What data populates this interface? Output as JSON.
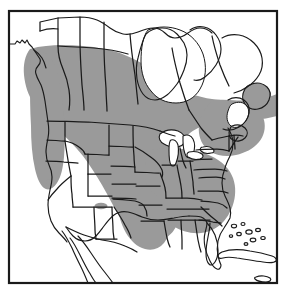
{
  "figure": {
    "type": "species-range-map",
    "region": "North America",
    "title": "",
    "caption": "",
    "width": 286,
    "height": 291
  },
  "style": {
    "background_color": "#ffffff",
    "land_fill": "#ffffff",
    "range_fill": "#9a9a9a",
    "outline_color": "#1a1a1a",
    "frame_color": "#1a1a1a",
    "frame_width": 2.2,
    "coast_width": 1.1,
    "border_width": 1.3
  },
  "frame": {
    "x": 9,
    "y": 11,
    "width": 268,
    "height": 272
  },
  "legend": {
    "items": [
      {
        "label": "",
        "swatch": "#9a9a9a",
        "meaning": "breeding range"
      }
    ],
    "visible": false
  },
  "map": {
    "landmasses": [
      "North American mainland",
      "Alaska panhandle",
      "Canadian Arctic coast",
      "Hudson Bay",
      "Newfoundland",
      "Nova Scotia",
      "Florida peninsula",
      "Baja California",
      "Bahamas",
      "Cuba"
    ],
    "water_bodies": [
      "Hudson Bay",
      "Great Lakes",
      "Gulf of Mexico",
      "Gulf of California",
      "Gulf of St. Lawrence",
      "Atlantic Ocean",
      "Pacific Ocean"
    ],
    "great_lakes": [
      "Lake Superior",
      "Lake Michigan",
      "Lake Huron",
      "Lake Erie",
      "Lake Ontario"
    ],
    "shaded_regions": [
      "British Columbia interior",
      "Alberta",
      "Saskatchewan",
      "Manitoba",
      "Ontario",
      "Quebec",
      "Maritimes",
      "Washington",
      "Oregon",
      "Montana",
      "Wyoming",
      "Colorado",
      "North Dakota",
      "South Dakota",
      "Nebraska",
      "Kansas",
      "Minnesota",
      "Iowa",
      "Missouri",
      "Arkansas",
      "Louisiana",
      "Mississippi",
      "Alabama",
      "Tennessee",
      "Kentucky",
      "Illinois",
      "Indiana",
      "Ohio",
      "Michigan",
      "Wisconsin",
      "Pennsylvania",
      "New York",
      "New England",
      "Virginia",
      "West Virginia",
      "North Carolina",
      "South Carolina",
      "Georgia"
    ],
    "unshaded_regions": [
      "Northern Canada",
      "Yukon",
      "Northwest Territories",
      "Nunavut",
      "Labrador interior",
      "California",
      "Nevada",
      "Utah",
      "Arizona",
      "New Mexico",
      "Idaho",
      "Texas",
      "Oklahoma",
      "Florida",
      "Mexico",
      "Cuba",
      "Bahamas"
    ],
    "isolated_population_dots": [
      {
        "name": "northern-california-dot",
        "cx": 49,
        "cy": 182,
        "r": 2.6
      },
      {
        "name": "arizona-new-mexico-dot",
        "cx": 99,
        "cy": 206,
        "r": 3.4
      },
      {
        "name": "arizona-new-mexico-dot-2",
        "cx": 104,
        "cy": 206,
        "r": 2.6
      }
    ]
  }
}
